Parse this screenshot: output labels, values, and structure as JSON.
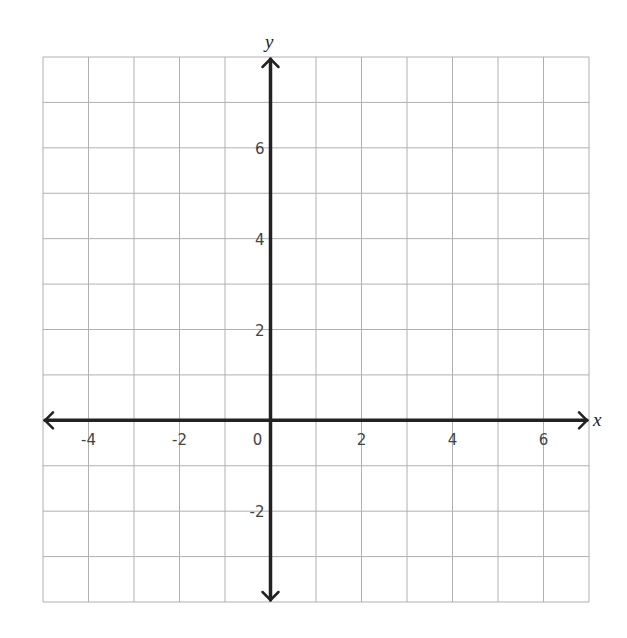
{
  "chart_data": {
    "type": "scatter",
    "title": "",
    "xlabel": "x",
    "ylabel": "y",
    "xlim": [
      -5,
      7
    ],
    "ylim": [
      -4,
      8
    ],
    "grid": true,
    "grid_step": 1,
    "x_ticks": [
      -4,
      -2,
      0,
      2,
      4,
      6
    ],
    "y_ticks": [
      -2,
      2,
      4,
      6
    ],
    "x_tick_labels": [
      "-4",
      "-2",
      "0",
      "2",
      "4",
      "6"
    ],
    "y_tick_labels": [
      "-2",
      "2",
      "4",
      "6"
    ],
    "origin_label": "0",
    "series": [],
    "colors": {
      "grid": "#b0b0b0",
      "axis": "#222222",
      "text": "#444444"
    }
  }
}
